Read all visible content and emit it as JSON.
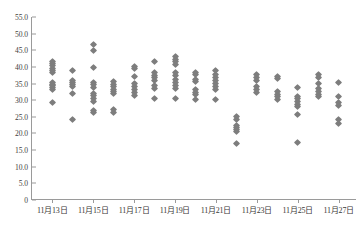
{
  "chart_data": {
    "type": "scatter",
    "title": "",
    "subtitle": "",
    "xlabel": "",
    "ylabel": "",
    "ylim": [
      0,
      55
    ],
    "ytick_values": [
      0,
      5,
      10,
      15,
      20,
      25,
      30,
      35,
      40,
      45,
      50,
      55
    ],
    "ytick_labels": [
      "0",
      "5.0",
      "10.0",
      "15.0",
      "20.0",
      "25.0",
      "30.0",
      "35.0",
      "40.0",
      "45.0",
      "50.0",
      "55.0"
    ],
    "grid": false,
    "legend": null,
    "marker": {
      "shape": "diamond",
      "color": "#7d7d7d",
      "size": 5
    },
    "axis_color": "#9a9a9a",
    "categories": [
      "11月13日",
      "11月14日",
      "11月15日",
      "11月16日",
      "11月17日",
      "11月18日",
      "11月19日",
      "11月20日",
      "11月21日",
      "11月22日",
      "11月23日",
      "11月24日",
      "11月25日",
      "11月26日",
      "11月27日"
    ],
    "xtick_labels": [
      "11月13日",
      "11月15日",
      "11月17日",
      "11月19日",
      "11月21日",
      "11月23日",
      "11月25日",
      "11月27日"
    ],
    "xtick_category_index": [
      0,
      2,
      4,
      6,
      8,
      10,
      12,
      14
    ],
    "series": [
      {
        "name": "観測値",
        "points": [
          {
            "category": "11月13日",
            "values": [
              41.5,
              41.0,
              40.3,
              39.6,
              39.0,
              38.3,
              35.3,
              34.8,
              34.3,
              33.8,
              33.3,
              29.3
            ]
          },
          {
            "category": "11月14日",
            "values": [
              38.9,
              36.0,
              35.3,
              34.7,
              34.0,
              32.0,
              24.2
            ]
          },
          {
            "category": "11月15日",
            "values": [
              46.7,
              44.8,
              39.8,
              35.3,
              34.6,
              33.9,
              32.0,
              31.3,
              30.6,
              29.6,
              27.0,
              26.3
            ]
          },
          {
            "category": "11月16日",
            "values": [
              35.6,
              34.8,
              34.0,
              33.3,
              32.6,
              31.9,
              27.2,
              26.4
            ]
          },
          {
            "category": "11月17日",
            "values": [
              40.2,
              39.4,
              37.0,
              34.9,
              34.0,
              33.2,
              32.2,
              31.4
            ]
          },
          {
            "category": "11月18日",
            "values": [
              41.5,
              38.2,
              37.5,
              36.8,
              36.0,
              34.3,
              33.6,
              30.5
            ]
          },
          {
            "category": "11月19日",
            "values": [
              43.0,
              42.3,
              41.5,
              40.8,
              38.3,
              37.4,
              36.3,
              35.3,
              34.5,
              33.6,
              30.6
            ]
          },
          {
            "category": "11月20日",
            "values": [
              38.4,
              37.6,
              36.3,
              35.5,
              33.3,
              32.4,
              31.6,
              30.2
            ]
          },
          {
            "category": "11月21日",
            "values": [
              38.8,
              37.8,
              36.8,
              35.8,
              34.9,
              34.0,
              33.2,
              30.3
            ]
          },
          {
            "category": "11月22日",
            "values": [
              25.0,
              24.3,
              22.4,
              21.8,
              21.2,
              20.6,
              17.0
            ]
          },
          {
            "category": "11月23日",
            "values": [
              37.8,
              36.8,
              35.8,
              34.0,
              33.2,
              32.4
            ]
          },
          {
            "category": "11月24日",
            "values": [
              37.2,
              36.4,
              32.6,
              31.8,
              31.0,
              30.2
            ]
          },
          {
            "category": "11月25日",
            "values": [
              33.8,
              31.2,
              30.4,
              29.6,
              28.8,
              28.0,
              25.6,
              17.3
            ]
          },
          {
            "category": "11月26日",
            "values": [
              37.8,
              36.8,
              35.0,
              33.4,
              32.6,
              31.8,
              31.0
            ]
          },
          {
            "category": "11月27日",
            "values": [
              35.3,
              31.2,
              29.2,
              28.4,
              24.3,
              22.9
            ]
          }
        ]
      }
    ]
  }
}
